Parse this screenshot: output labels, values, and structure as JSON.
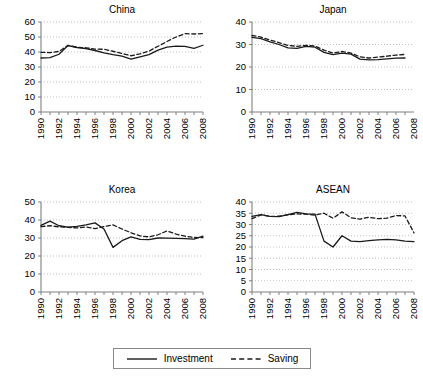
{
  "figure": {
    "background": "#ffffff",
    "line_color": "#1a1a1a",
    "grid_color": "#bfbfbf",
    "axis_color": "#808080"
  },
  "legend": {
    "position": "bottom-center",
    "entries": [
      {
        "label": "Investment",
        "style": "solid",
        "icon": "solid-line-swatch"
      },
      {
        "label": "Saving",
        "style": "dashed",
        "icon": "dashed-line-swatch"
      }
    ]
  },
  "chart_data": [
    {
      "type": "line",
      "title": "China",
      "xlabel": "",
      "ylabel": "",
      "xlim": [
        1990,
        2008
      ],
      "ylim": [
        0,
        60
      ],
      "yticks": [
        0,
        10,
        20,
        30,
        40,
        50,
        60
      ],
      "xticks": [
        1990,
        1992,
        1994,
        1996,
        1998,
        2000,
        2002,
        2004,
        2006,
        2008
      ],
      "x": [
        1990,
        1991,
        1992,
        1993,
        1994,
        1995,
        1996,
        1997,
        1998,
        1999,
        2000,
        2001,
        2002,
        2003,
        2004,
        2005,
        2006,
        2007,
        2008
      ],
      "grid": true,
      "series": [
        {
          "name": "Investment",
          "style": "solid",
          "values": [
            36.0,
            36.2,
            38.5,
            44.3,
            43.0,
            42.2,
            41.0,
            39.4,
            38.2,
            37.3,
            35.3,
            36.7,
            38.2,
            41.3,
            43.2,
            43.9,
            43.8,
            42.4,
            44.5
          ]
        },
        {
          "name": "Saving",
          "style": "dashed",
          "values": [
            39.8,
            39.6,
            40.4,
            44.4,
            43.2,
            42.8,
            41.9,
            41.8,
            40.5,
            39.0,
            37.5,
            38.8,
            40.6,
            43.8,
            47.0,
            50.0,
            52.2,
            52.0,
            52.3
          ]
        }
      ]
    },
    {
      "type": "line",
      "title": "Japan",
      "xlabel": "",
      "ylabel": "",
      "xlim": [
        1990,
        2008
      ],
      "ylim": [
        0,
        40
      ],
      "yticks": [
        0,
        10,
        20,
        30,
        40
      ],
      "xticks": [
        1990,
        1992,
        1994,
        1996,
        1998,
        2000,
        2002,
        2004,
        2006,
        2008
      ],
      "x": [
        1990,
        1991,
        1992,
        1993,
        1994,
        1995,
        1996,
        1997,
        1998,
        1999,
        2000,
        2001,
        2002,
        2003,
        2004,
        2005,
        2006,
        2007
      ],
      "grid": true,
      "series": [
        {
          "name": "Investment",
          "style": "solid",
          "values": [
            33.2,
            32.6,
            31.2,
            30.0,
            28.5,
            28.3,
            29.2,
            28.8,
            26.5,
            25.5,
            26.2,
            25.7,
            23.5,
            23.2,
            23.3,
            23.6,
            23.9,
            24.0
          ]
        },
        {
          "name": "Saving",
          "style": "dashed",
          "values": [
            34.0,
            33.3,
            32.0,
            30.8,
            29.6,
            29.2,
            29.6,
            29.3,
            27.5,
            26.2,
            26.9,
            26.2,
            24.5,
            24.0,
            24.4,
            24.8,
            25.3,
            25.6
          ]
        }
      ]
    },
    {
      "type": "line",
      "title": "Korea",
      "xlabel": "",
      "ylabel": "",
      "xlim": [
        1990,
        2008
      ],
      "ylim": [
        0,
        50
      ],
      "yticks": [
        0,
        10,
        20,
        30,
        40,
        50
      ],
      "xticks": [
        1990,
        1992,
        1994,
        1996,
        1998,
        2000,
        2002,
        2004,
        2006,
        2008
      ],
      "x": [
        1990,
        1991,
        1992,
        1993,
        1994,
        1995,
        1996,
        1997,
        1998,
        1999,
        2000,
        2001,
        2002,
        2003,
        2004,
        2005,
        2006,
        2007,
        2008
      ],
      "grid": true,
      "series": [
        {
          "name": "Investment",
          "style": "solid",
          "values": [
            37.0,
            39.4,
            36.8,
            36.0,
            36.5,
            37.3,
            38.4,
            35.0,
            24.8,
            28.5,
            30.6,
            29.2,
            29.1,
            30.0,
            29.9,
            29.8,
            29.6,
            29.4,
            31.0
          ]
        },
        {
          "name": "Saving",
          "style": "dashed",
          "values": [
            36.3,
            36.8,
            36.2,
            35.9,
            35.6,
            36.1,
            35.2,
            36.4,
            37.3,
            35.0,
            32.9,
            31.2,
            30.6,
            31.8,
            33.9,
            32.2,
            31.0,
            30.3,
            30.2
          ]
        }
      ]
    },
    {
      "type": "line",
      "title": "ASEAN",
      "xlabel": "",
      "ylabel": "",
      "xlim": [
        1990,
        2008
      ],
      "ylim": [
        0,
        40
      ],
      "yticks": [
        0,
        5,
        10,
        15,
        20,
        25,
        30,
        35,
        40
      ],
      "xticks": [
        1990,
        1992,
        1994,
        1996,
        1998,
        2000,
        2002,
        2004,
        2006,
        2008
      ],
      "x": [
        1990,
        1991,
        1992,
        1993,
        1994,
        1995,
        1996,
        1997,
        1998,
        1999,
        2000,
        2001,
        2002,
        2003,
        2004,
        2005,
        2006,
        2007,
        2008
      ],
      "grid": true,
      "series": [
        {
          "name": "Investment",
          "style": "solid",
          "values": [
            33.6,
            34.4,
            33.6,
            33.5,
            34.4,
            35.4,
            34.7,
            34.6,
            22.6,
            20.0,
            25.0,
            22.6,
            22.4,
            22.8,
            23.2,
            23.4,
            23.2,
            22.6,
            22.4
          ]
        },
        {
          "name": "Saving",
          "style": "dashed",
          "values": [
            32.6,
            34.3,
            33.6,
            33.7,
            34.3,
            34.7,
            34.6,
            34.2,
            35.0,
            32.8,
            35.6,
            33.0,
            32.4,
            33.2,
            32.6,
            32.8,
            34.0,
            33.8,
            26.3
          ]
        }
      ]
    }
  ]
}
